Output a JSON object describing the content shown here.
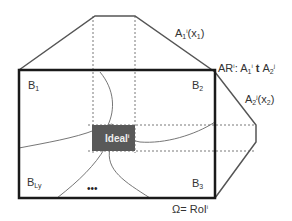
{
  "diagram": {
    "labels": {
      "b1": {
        "main": "B",
        "sub": "1"
      },
      "b2": {
        "main": "B",
        "sub": "2"
      },
      "b3": {
        "main": "B",
        "sub": "3"
      },
      "bly": {
        "main": "B",
        "sub": "Ly"
      },
      "ellipsis": "•••",
      "ideal": {
        "main": "Ideal",
        "sup": "i"
      },
      "a1": {
        "main": "A",
        "sub": "1",
        "sup": "i",
        "arg": "(x",
        "argsub": "1",
        "close": ")"
      },
      "a2": {
        "main": "A",
        "sub": "2",
        "sup": "j",
        "arg": "(x",
        "argsub": "2",
        "close": ")"
      },
      "ar": {
        "main": "AR",
        "sup": "i",
        "sep": ": A",
        "sub1": "1",
        "sup1": "i",
        "op": " t ",
        "a": "A",
        "sub2": "2",
        "sup2": "j"
      },
      "omega": {
        "main": "Ω= RoI",
        "sup": "i"
      }
    },
    "colors": {
      "frame": "#1a1a1a",
      "polygon": "#555555",
      "curves": "#666666",
      "dashed": "#555555",
      "ideal_fill": "#595959",
      "text": "#333333"
    }
  }
}
